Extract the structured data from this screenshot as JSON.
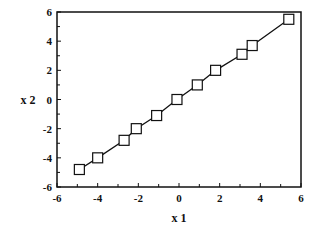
{
  "chart_data": {
    "type": "line",
    "title": "",
    "xlabel": "x 1",
    "ylabel": "x 2",
    "xlim": [
      -6,
      6
    ],
    "ylim": [
      -6,
      6
    ],
    "xticks": [
      -6,
      -4,
      -2,
      0,
      2,
      4,
      6
    ],
    "yticks": [
      -6,
      -4,
      -2,
      0,
      2,
      4,
      6
    ],
    "grid": false,
    "legend": null,
    "marker": "open-square",
    "series": [
      {
        "name": "x2 vs x1",
        "x": [
          -4.9,
          -4.0,
          -2.7,
          -2.1,
          -1.1,
          -0.1,
          0.9,
          1.8,
          3.1,
          3.6,
          5.4
        ],
        "y": [
          -4.8,
          -4.0,
          -2.8,
          -2.0,
          -1.1,
          0.0,
          1.0,
          2.0,
          3.1,
          3.7,
          5.5
        ]
      }
    ]
  },
  "colors": {
    "axis": "#111111",
    "line": "#111111",
    "marker_fill": "#ffffff"
  }
}
